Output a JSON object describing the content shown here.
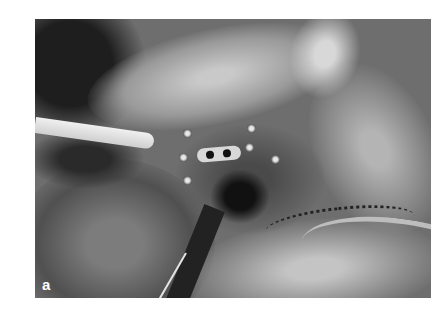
{
  "figure": {
    "panel_label": "a",
    "type": "grayscale clinical photograph"
  }
}
